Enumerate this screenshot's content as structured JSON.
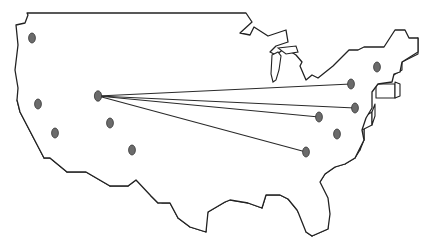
{
  "figure": {
    "colors": {
      "background": "#ffffff",
      "outline": "#222222",
      "marker_fill": "#6b6b6b",
      "route_line": "#2a2a2a"
    },
    "hub": {
      "id": "hub",
      "x": 98,
      "y": 96
    },
    "markers": [
      {
        "id": "m1",
        "x": 32,
        "y": 38
      },
      {
        "id": "m2",
        "x": 38,
        "y": 104
      },
      {
        "id": "m3",
        "x": 55,
        "y": 133
      },
      {
        "id": "m4",
        "x": 110,
        "y": 123
      },
      {
        "id": "m5",
        "x": 132,
        "y": 150
      },
      {
        "id": "m6",
        "x": 351,
        "y": 84
      },
      {
        "id": "m7",
        "x": 377,
        "y": 67
      },
      {
        "id": "m8",
        "x": 355,
        "y": 108
      },
      {
        "id": "m9",
        "x": 319,
        "y": 117
      },
      {
        "id": "m10",
        "x": 337,
        "y": 134
      },
      {
        "id": "m11",
        "x": 306,
        "y": 152
      }
    ],
    "routes": [
      {
        "from": "hub",
        "to": "m6"
      },
      {
        "from": "hub",
        "to": "m8"
      },
      {
        "from": "hub",
        "to": "m9"
      },
      {
        "from": "hub",
        "to": "m11"
      }
    ]
  }
}
